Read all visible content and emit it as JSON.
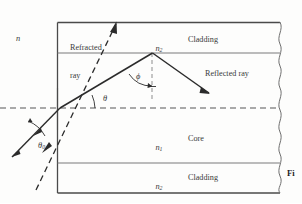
{
  "figure": {
    "title_truncated": "Fi",
    "caption_lines": [
      "rep",
      "me",
      "op"
    ],
    "background_color": "#fdfdfc",
    "line_color": "#2b2b2b",
    "interface_color": "#6d6d6d",
    "dash_color": "#8a8a8a",
    "text_color": "#3a3a3a"
  },
  "labels": {
    "n_outer": "n",
    "refracted_ray_line1": "Refracted",
    "refracted_ray_line2": "ray",
    "reflected_ray": "Reflected ray",
    "cladding_top": "Cladding",
    "cladding_bottom": "Cladding",
    "core": "Core",
    "n2_top_base": "n",
    "n2_top_sub": "2",
    "n1_core_base": "n",
    "n1_core_sub": "1",
    "n2_bottom_base": "n",
    "n2_bottom_sub": "2",
    "theta_zero_base": "θ",
    "theta_zero_sub": "0",
    "theta": "θ",
    "phi": "ϕ"
  },
  "geometry": {
    "box_left": 57,
    "box_top": 22,
    "box_right": 280,
    "box_bottom": 193,
    "top_interface_y": 53,
    "bottom_interface_y": 163,
    "axis_y": 108,
    "incidence_point": [
      60,
      108
    ],
    "reflection_point": [
      152,
      53
    ],
    "refracted_arrow_tip": [
      116,
      22
    ],
    "reflected_arrow_tip": [
      208,
      92
    ],
    "incoming_arrow_tip": [
      12,
      155
    ]
  }
}
